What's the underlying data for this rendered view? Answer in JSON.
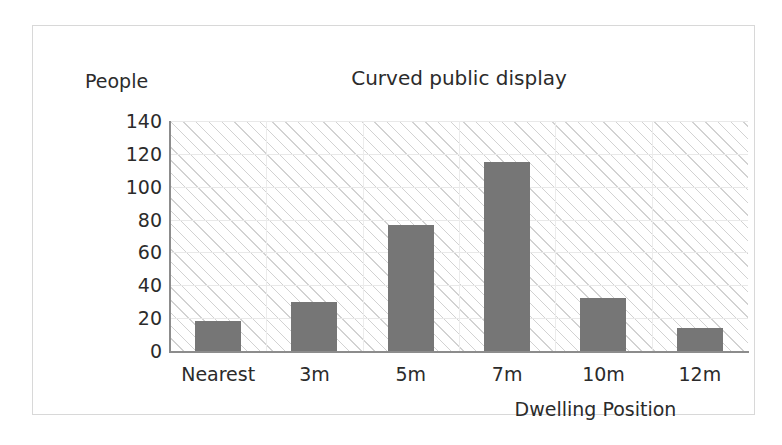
{
  "chart_data": {
    "type": "bar",
    "title": "Curved public display",
    "xlabel": "Dwelling Position",
    "ylabel": "People",
    "categories": [
      "Nearest",
      "3m",
      "5m",
      "7m",
      "10m",
      "12m"
    ],
    "values": [
      18,
      30,
      77,
      115,
      32,
      14
    ],
    "ylim": [
      0,
      140
    ],
    "ytick_step": 20,
    "ytick_labels": [
      "140",
      "120",
      "100",
      "80",
      "60",
      "40",
      "20",
      "0"
    ],
    "ytick_values": [
      140,
      120,
      100,
      80,
      60,
      40,
      20,
      0
    ],
    "grid": true,
    "legend": "none",
    "bar_color": "#767676",
    "plot_background": "#ffffff",
    "hatch_color": "#d2d2d2",
    "axis_color": "#8c8c8c",
    "frame_color": "#d8d8d8",
    "text_color": "#2b2b2b"
  }
}
